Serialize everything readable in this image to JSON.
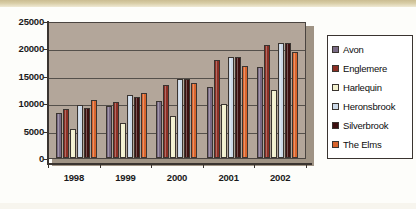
{
  "chart_data": {
    "type": "bar",
    "title": "",
    "xlabel": "",
    "ylabel": "",
    "categories": [
      "1998",
      "1999",
      "2000",
      "2001",
      "2002"
    ],
    "ylim": [
      0,
      25000
    ],
    "ytick_labels": [
      "25000",
      "20000",
      "15000",
      "10000",
      "5000",
      "0"
    ],
    "ytick_values": [
      25000,
      20000,
      15000,
      10000,
      5000,
      0
    ],
    "grid": true,
    "legend_position": "right",
    "series": [
      {
        "name": "Avon",
        "color": "#7a6b86",
        "values": [
          8200,
          9500,
          10400,
          13000,
          16600
        ]
      },
      {
        "name": "Englemere",
        "color": "#8c2f24",
        "values": [
          9000,
          10200,
          13300,
          17900,
          20700
        ]
      },
      {
        "name": "Harlequin",
        "color": "#f2f0cd",
        "values": [
          5300,
          6300,
          7600,
          9800,
          12400
        ]
      },
      {
        "name": "Heronsbrook",
        "color": "#ccd9e8",
        "values": [
          9600,
          11500,
          14500,
          18500,
          21000
        ]
      },
      {
        "name": "Silverbrook",
        "color": "#3d1010",
        "values": [
          9200,
          11200,
          14400,
          18500,
          20900
        ]
      },
      {
        "name": "The Elms",
        "color": "#d9642c",
        "values": [
          10500,
          11800,
          13700,
          16700,
          19300
        ]
      }
    ]
  },
  "axis": {
    "y_labels": [
      "25000",
      "20000",
      "15000",
      "10000",
      "5000",
      "0"
    ],
    "x_labels": [
      "1998",
      "1999",
      "2000",
      "2001",
      "2002"
    ]
  },
  "legend": {
    "items": [
      {
        "label": "Avon"
      },
      {
        "label": "Englemere"
      },
      {
        "label": "Harlequin"
      },
      {
        "label": "Heronsbrook"
      },
      {
        "label": "Silverbrook"
      },
      {
        "label": "The Elms"
      }
    ]
  }
}
